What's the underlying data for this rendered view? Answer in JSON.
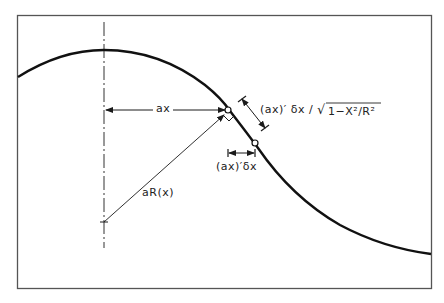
{
  "diagram": {
    "type": "geometric construction",
    "colors": {
      "ink": "#1a1a1a",
      "frame": "#555555",
      "background": "#ffffff"
    },
    "labels": {
      "ax": "ax",
      "aR": "aR(x)",
      "arc_element": "(ax)′ δx / √(1−X²/R²)",
      "arc_element_prefix": "(ax)′ δx /",
      "arc_element_sqrt": "√",
      "arc_element_radicand": "1−X²/R²",
      "horizontal_element": "(ax)′δx"
    },
    "elements": [
      {
        "name": "frame",
        "kind": "rectangle"
      },
      {
        "name": "symmetry-axis",
        "kind": "dash-dot vertical line"
      },
      {
        "name": "profile-curve",
        "kind": "bell-shaped curve"
      },
      {
        "name": "ax-dimension",
        "kind": "double arrow, horizontal"
      },
      {
        "name": "aR-vector",
        "kind": "arrow from axis to curve point"
      },
      {
        "name": "right-angle-marker",
        "kind": "small square at curve point"
      },
      {
        "name": "point-1",
        "kind": "open circle on curve"
      },
      {
        "name": "point-2",
        "kind": "open circle on curve"
      },
      {
        "name": "arc-length-dimension",
        "kind": "dimension line parallel to curve"
      },
      {
        "name": "horizontal-element-dimension",
        "kind": "short horizontal dimension line"
      }
    ]
  }
}
